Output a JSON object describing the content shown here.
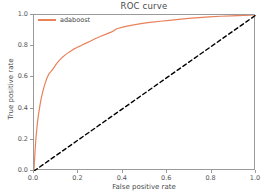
{
  "chart_data": {
    "type": "line",
    "title": "ROC curve",
    "xlabel": "False positive rate",
    "ylabel": "True positive rate",
    "xlim": [
      0.0,
      1.0
    ],
    "ylim": [
      0.0,
      1.0
    ],
    "grid": false,
    "legend_position": "upper left",
    "xticks": [
      "0.0",
      "0.2",
      "0.4",
      "0.6",
      "0.8",
      "1.0"
    ],
    "xtick_values": [
      0.0,
      0.2,
      0.4,
      0.6,
      0.8,
      1.0
    ],
    "yticks": [
      "0.0",
      "0.2",
      "0.4",
      "0.6",
      "0.8",
      "1.0"
    ],
    "ytick_values": [
      0.0,
      0.2,
      0.4,
      0.6,
      0.8,
      1.0
    ],
    "series": [
      {
        "name": "adaboost",
        "color": "#e8825a",
        "style": "solid",
        "width": 1.2,
        "x": [
          0.0,
          0.002,
          0.004,
          0.006,
          0.008,
          0.01,
          0.013,
          0.016,
          0.02,
          0.025,
          0.03,
          0.036,
          0.043,
          0.05,
          0.058,
          0.067,
          0.077,
          0.088,
          0.1,
          0.113,
          0.127,
          0.142,
          0.158,
          0.175,
          0.193,
          0.212,
          0.232,
          0.253,
          0.275,
          0.298,
          0.322,
          0.347,
          0.36,
          0.373,
          0.4,
          0.43,
          0.462,
          0.496,
          0.532,
          0.57,
          0.61,
          0.652,
          0.696,
          0.742,
          0.79,
          0.84,
          0.892,
          0.946,
          1.0
        ],
        "y": [
          0.01,
          0.06,
          0.11,
          0.155,
          0.195,
          0.23,
          0.275,
          0.315,
          0.36,
          0.405,
          0.448,
          0.488,
          0.528,
          0.562,
          0.595,
          0.622,
          0.638,
          0.66,
          0.685,
          0.708,
          0.728,
          0.746,
          0.762,
          0.778,
          0.792,
          0.804,
          0.818,
          0.832,
          0.848,
          0.862,
          0.876,
          0.89,
          0.9,
          0.912,
          0.922,
          0.932,
          0.94,
          0.948,
          0.954,
          0.96,
          0.966,
          0.972,
          0.978,
          0.983,
          0.988,
          0.992,
          0.995,
          0.998,
          1.0
        ]
      },
      {
        "name": "chance",
        "color": "#000000",
        "style": "dashed",
        "width": 1.4,
        "x": [
          0.0,
          1.0
        ],
        "y": [
          0.0,
          1.0
        ]
      }
    ],
    "legend_entries": [
      {
        "label": "adaboost",
        "color": "#e8825a"
      }
    ]
  },
  "figure": {
    "background": "#ffffff",
    "axes_border_color": "#9a9a9a"
  },
  "legend": {
    "label": "adaboost"
  },
  "axes": {
    "title": "ROC curve",
    "xlabel": "False positive rate",
    "ylabel": "True positive rate"
  }
}
